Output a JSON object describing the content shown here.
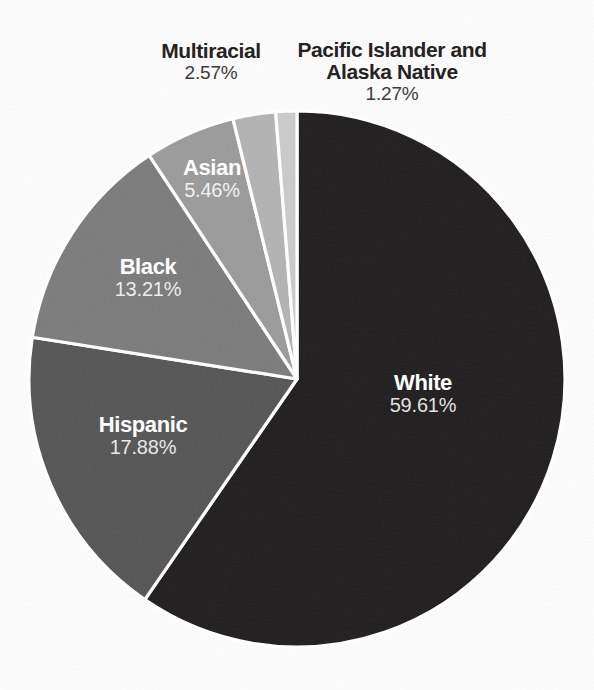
{
  "chart_data": {
    "type": "pie",
    "title": "",
    "unit": "%",
    "start_angle_deg": 0,
    "direction": "clockwise",
    "background_color": "#fcfcfc",
    "separator_color": "#ffffff",
    "legend": "none (direct slice labels)",
    "slices": [
      {
        "label": "White",
        "value": 59.61,
        "display": "59.61%",
        "color": "#211e1f",
        "label_position": "inside",
        "label_color": "#ffffff"
      },
      {
        "label": "Hispanic",
        "value": 17.88,
        "display": "17.88%",
        "color": "#565656",
        "label_position": "inside",
        "label_color": "#ffffff"
      },
      {
        "label": "Black",
        "value": 13.21,
        "display": "13.21%",
        "color": "#7c7c7c",
        "label_position": "inside",
        "label_color": "#ffffff"
      },
      {
        "label": "Asian",
        "value": 5.46,
        "display": "5.46%",
        "color": "#9b9b9b",
        "label_position": "inside",
        "label_color": "#ffffff"
      },
      {
        "label": "Multiracial",
        "value": 2.57,
        "display": "2.57%",
        "color": "#b3b3b3",
        "label_position": "outside",
        "label_color": "#262223"
      },
      {
        "label": "Pacific Islander and Alaska Native",
        "value": 1.27,
        "display": "1.27%",
        "color": "#cacaca",
        "label_position": "outside",
        "label_color": "#262223",
        "label_lines": [
          "Pacific Islander and",
          "Alaska Native"
        ]
      }
    ]
  }
}
